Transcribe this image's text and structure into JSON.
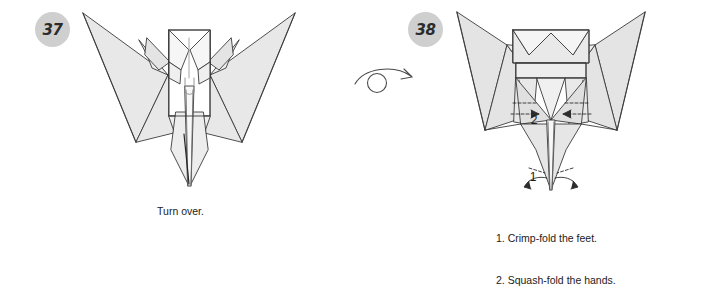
{
  "document": {
    "type": "origami-instruction-diagram",
    "background_color": "#ffffff",
    "paper_fill_color": "#e6e6e6",
    "paper_fill_light": "#f2f2f2",
    "line_color": "#3a3a3a",
    "badge_color": "#cfcfcf",
    "badge_text_color": "#2b2b2b",
    "text_color": "#222222"
  },
  "steps": [
    {
      "number": "37",
      "badge_name": "step-number-37",
      "caption": "Turn over.",
      "figure_name": "origami-figure-step-37",
      "figure_description": "Bird form, front view, wings spread upward, narrow pointed tail below",
      "annotations": []
    },
    {
      "number": "38",
      "badge_name": "step-number-38",
      "caption_lines": [
        "1. Crimp-fold the feet.",
        "2. Squash-fold the hands."
      ],
      "figure_name": "origami-figure-step-38",
      "figure_description": "Reversed bird form, wings spread, head with V notch, legs and feet below",
      "annotations": [
        {
          "label": "1",
          "name": "annotation-label-1",
          "refers_to": "crimp-fold the feet"
        },
        {
          "label": "2",
          "name": "annotation-label-2",
          "refers_to": "squash-fold the hands"
        }
      ]
    }
  ],
  "symbols": {
    "turn_over": {
      "name": "turn-over-arrow-symbol",
      "description": "Circle with sweeping arc arrow pointing right, indicating turn the model over"
    }
  }
}
